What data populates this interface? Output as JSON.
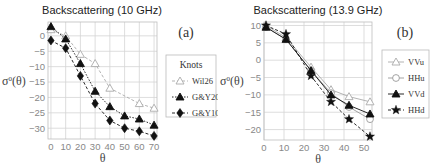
{
  "chart_data": [
    {
      "type": "line",
      "panel_label": "(a)",
      "title": "Backscattering (10 GHz)",
      "xlabel": "θ",
      "ylabel": "σ⁰(θ)",
      "xlim": [
        -2,
        72
      ],
      "ylim": [
        -33.5,
        4.5
      ],
      "xticks": [
        0,
        10,
        20,
        30,
        40,
        50,
        60,
        70
      ],
      "yticks": [
        0,
        -5,
        -10,
        -15,
        -20,
        -25,
        -30
      ],
      "grid": true,
      "legend": {
        "title": "Knots",
        "position": "right"
      },
      "series": [
        {
          "name": "Wil26",
          "marker": "triangle-open",
          "line": "dashed",
          "color": "#aaaaaa",
          "x": [
            0,
            10,
            20,
            30,
            40,
            60,
            70
          ],
          "y": [
            2,
            0,
            -6,
            -9,
            -17,
            -22,
            -23.5
          ]
        },
        {
          "name": "G&Y20",
          "marker": "triangle-filled",
          "line": "dotted",
          "color": "#111111",
          "x": [
            0,
            10,
            20,
            30,
            40,
            50,
            60,
            70
          ],
          "y": [
            3,
            -1,
            -9,
            -18,
            -23,
            -26,
            -27,
            -29
          ]
        },
        {
          "name": "G&Y10",
          "marker": "diamond-filled",
          "line": "dashed",
          "color": "#111111",
          "x": [
            0,
            10,
            20,
            30,
            40,
            50,
            60,
            70
          ],
          "y": [
            -1.5,
            -4,
            -13,
            -22,
            -27.5,
            -30,
            -31,
            -32.5
          ]
        }
      ]
    },
    {
      "type": "line",
      "panel_label": "(b)",
      "title": "Backscattering (13.9 GHz)",
      "xlabel": "θ",
      "ylabel": "σ⁰(θ)",
      "xlim": [
        0,
        54
      ],
      "ylim": [
        -23,
        11
      ],
      "xticks": [
        0,
        10,
        20,
        30,
        40,
        50
      ],
      "yticks": [
        10,
        5,
        0,
        -5,
        -10,
        -15,
        -20
      ],
      "grid": true,
      "legend": {
        "title": "",
        "position": "right"
      },
      "series": [
        {
          "name": "VVu",
          "marker": "triangle-open",
          "line": "solid",
          "color": "#aaaaaa",
          "x": [
            1,
            11,
            23.5,
            33.5,
            42.5,
            53
          ],
          "y": [
            10,
            6.5,
            -2,
            -8.5,
            -10.5,
            -12
          ]
        },
        {
          "name": "HHu",
          "marker": "circle-open",
          "line": "solid",
          "color": "#999999",
          "x": [
            1,
            11,
            23.5,
            33.5,
            42.5,
            53
          ],
          "y": [
            9.5,
            6,
            -3,
            -9.5,
            -13.5,
            -17
          ]
        },
        {
          "name": "VVd",
          "marker": "triangle-filled",
          "line": "solid",
          "color": "#111111",
          "x": [
            1,
            11,
            23.5,
            33.5,
            42.5,
            53
          ],
          "y": [
            9.5,
            6,
            -3,
            -10,
            -13,
            -15.5
          ]
        },
        {
          "name": "HHd",
          "marker": "star-filled",
          "line": "dashed",
          "color": "#111111",
          "x": [
            1,
            11,
            23.5,
            33.5,
            42.5,
            53
          ],
          "y": [
            10,
            7.5,
            -4.5,
            -12,
            -17,
            -22
          ]
        }
      ]
    }
  ],
  "panels": {
    "a": {
      "title": "Backscattering (10 GHz)",
      "label": "(a)",
      "xlabel": "θ",
      "ylabel": "σ⁰(θ)",
      "legend_title": "Knots",
      "legend": [
        "Wil26",
        "G&Y20",
        "G&Y10"
      ]
    },
    "b": {
      "title": "Backscattering (13.9 GHz)",
      "label": "(b)",
      "xlabel": "θ",
      "ylabel": "σ⁰(θ)",
      "legend": [
        "VVu",
        "HHu",
        "VVd",
        "HHd"
      ]
    }
  }
}
